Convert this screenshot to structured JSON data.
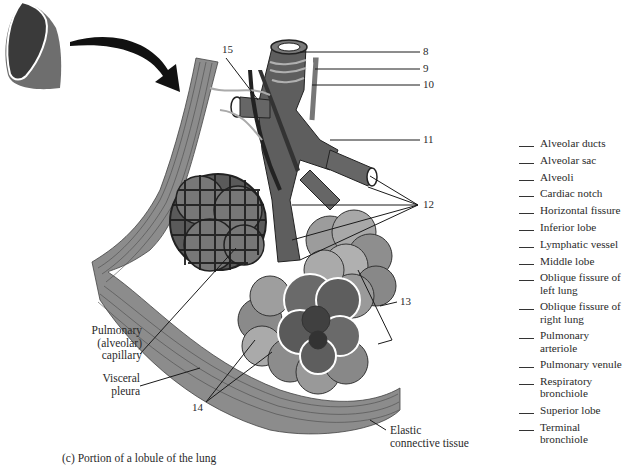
{
  "figure": {
    "caption": "(c) Portion of a lobule of the lung",
    "numbered_labels": [
      {
        "number": "8",
        "x": 423,
        "y": 52
      },
      {
        "number": "9",
        "x": 423,
        "y": 69
      },
      {
        "number": "10",
        "x": 423,
        "y": 85
      },
      {
        "number": "11",
        "x": 423,
        "y": 140
      },
      {
        "number": "12",
        "x": 423,
        "y": 205
      },
      {
        "number": "13",
        "x": 400,
        "y": 302
      },
      {
        "number": "14",
        "x": 190,
        "y": 408
      },
      {
        "number": "15",
        "x": 222,
        "y": 45
      }
    ],
    "text_labels": {
      "pulmonary_capillary": [
        "Pulmonary",
        "(alveolar)",
        "capillary"
      ],
      "visceral_pleura": [
        "Visceral",
        "pleura"
      ],
      "elastic_tissue": [
        "Elastic",
        "connective tissue"
      ]
    }
  },
  "word_bank": {
    "items": [
      {
        "label": "Alveolar ducts"
      },
      {
        "label": "Alveolar sac"
      },
      {
        "label": "Alveoli"
      },
      {
        "label": "Cardiac notch"
      },
      {
        "label": "Horizontal fissure"
      },
      {
        "label": "Inferior lobe"
      },
      {
        "label": "Lymphatic vessel"
      },
      {
        "label": "Middle lobe"
      },
      {
        "label": "Oblique fissure of left lung"
      },
      {
        "label": "Oblique fissure of right lung"
      },
      {
        "label": "Pulmonary arteriole"
      },
      {
        "label": "Pulmonary venule"
      },
      {
        "label": "Respiratory bronchiole"
      },
      {
        "label": "Superior lobe"
      },
      {
        "label": "Terminal bronchiole"
      }
    ]
  },
  "colors": {
    "dark_fill": "#3a3a3a",
    "mid_fill": "#6e6e6e",
    "light_fill": "#9a9a9a",
    "pale_fill": "#b8b8b8",
    "outline": "#222222"
  }
}
